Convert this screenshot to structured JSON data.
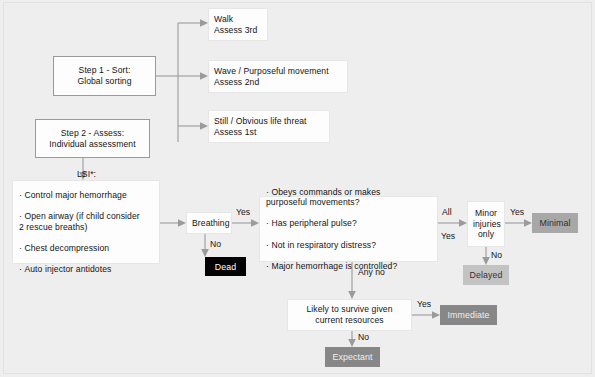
{
  "diagram": {
    "background_color": "#eeeeee",
    "line_color": "#9b9b9b"
  },
  "nodes": {
    "step1": {
      "label": "Step 1 - Sort:\ncentered Global sorting",
      "line1": "Step 1 - Sort:",
      "line2": "Global sorting"
    },
    "step2": {
      "line1": "Step 2 - Assess:",
      "line2": "Individual assessment"
    },
    "walk": {
      "line1": "Walk",
      "line2": "Assess 3rd"
    },
    "wave": {
      "line1": "Wave / Purposeful movement",
      "line2": "Assess 2nd"
    },
    "still": {
      "line1": "Still / Obvious life threat",
      "line2": "Assess 1st"
    },
    "lsi": {
      "heading": "LSI*:",
      "items": [
        "Control major hemorrhage",
        "Open airway (if child consider\n 2 rescue breaths)",
        "Chest decompression",
        "Auto injector antidotes"
      ]
    },
    "breathing": {
      "label": "Breathing"
    },
    "assessment": {
      "items": [
        "Obeys commands or makes\n  purposeful movements?",
        "Has peripheral pulse?",
        "Not in respiratory distress?",
        "Major hemorrhage is controlled?"
      ]
    },
    "minor_injuries": {
      "line1": "Minor",
      "line2": "injuries",
      "line3": "only"
    },
    "survive": {
      "line1": "Likely to survive given",
      "line2": "current resources"
    }
  },
  "outcomes": {
    "dead": {
      "label": "Dead",
      "color": "#030303",
      "text_color": "#ffffff"
    },
    "minimal": {
      "label": "Minimal",
      "color": "#a8a8a8",
      "text_color": "#2e2e2e"
    },
    "delayed": {
      "label": "Delayed",
      "color": "#c3c3c3",
      "text_color": "#333333"
    },
    "immediate": {
      "label": "Immediate",
      "color": "#878787",
      "text_color": "#efefef"
    },
    "expectant": {
      "label": "Expectant",
      "color": "#878787",
      "text_color": "#efefef"
    }
  },
  "edge_labels": {
    "breathing_yes": "Yes",
    "breathing_no": "No",
    "assessment_all": "All",
    "assessment_yes": "Yes",
    "assessment_any_no": "Any no",
    "minor_yes": "Yes",
    "minor_no": "No",
    "survive_yes": "Yes",
    "survive_no": "No"
  }
}
